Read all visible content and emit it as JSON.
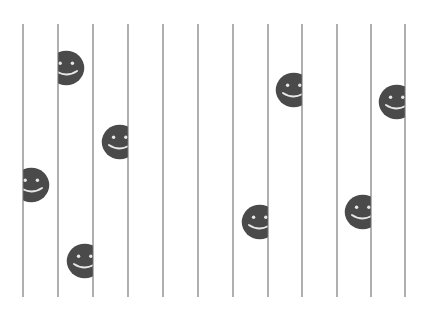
{
  "canvas": {
    "width": 428,
    "height": 310,
    "background_color": "#ffffff"
  },
  "chart_data": {
    "type": "scatter",
    "title": "",
    "subtitle": "",
    "xlabel": "",
    "ylabel": "",
    "grid": true,
    "legend": "none",
    "xlim": [
      0,
      428
    ],
    "ylim": [
      0,
      310
    ],
    "gridlines": {
      "orientation": "vertical",
      "count": 12,
      "color": "#6e6e6e",
      "stroke_width": 1.1,
      "y_top": 24,
      "y_bottom": 297,
      "x_positions": [
        23,
        58,
        93,
        128,
        163,
        198,
        233,
        268,
        302,
        337,
        371,
        405
      ],
      "spacing": 34.7
    },
    "faces": {
      "count": 8,
      "fill_color": "#4a4a4a",
      "feature_color": "#e8e8e8",
      "radius": 18,
      "items": [
        {
          "id": "face-1",
          "line_index": 1,
          "line_x": 58,
          "cy": 68,
          "side": "right"
        },
        {
          "id": "face-2",
          "line_index": 0,
          "line_x": 23,
          "cy": 185,
          "side": "right"
        },
        {
          "id": "face-3",
          "line_index": 3,
          "line_x": 128,
          "cy": 142,
          "side": "left"
        },
        {
          "id": "face-4",
          "line_index": 2,
          "line_x": 93,
          "cy": 261,
          "side": "left"
        },
        {
          "id": "face-5",
          "line_index": 8,
          "line_x": 302,
          "cy": 90,
          "side": "left"
        },
        {
          "id": "face-6",
          "line_index": 11,
          "line_x": 405,
          "cy": 102,
          "side": "left"
        },
        {
          "id": "face-7",
          "line_index": 7,
          "line_x": 268,
          "cy": 222,
          "side": "left"
        },
        {
          "id": "face-8",
          "line_index": 10,
          "line_x": 371,
          "cy": 212,
          "side": "left"
        }
      ]
    }
  }
}
